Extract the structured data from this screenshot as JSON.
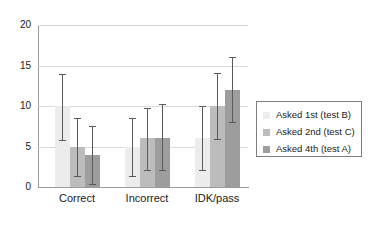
{
  "chart_data": {
    "type": "bar",
    "title": "",
    "subtitle": "",
    "xlabel": "",
    "ylabel": "",
    "categories": [
      "Correct",
      "Incorrect",
      "IDK/pass"
    ],
    "ylim": [
      0,
      20
    ],
    "yticks": [
      0,
      5,
      10,
      15,
      20
    ],
    "ytick_labels": [
      "0",
      "5",
      "10",
      "15",
      "20"
    ],
    "grid": "horizontal",
    "legend_position": "right",
    "orientation": "vertical",
    "series": [
      {
        "name": "Asked 1st (test B)",
        "color": "#ececec",
        "values": [
          10,
          5,
          6
        ],
        "err_low": [
          5.7,
          1.2,
          2.0
        ],
        "err_high": [
          14.0,
          8.5,
          10.0
        ]
      },
      {
        "name": "Asked 2nd (test C)",
        "color": "#bcbcbc",
        "values": [
          5,
          6,
          10
        ],
        "err_low": [
          1.2,
          2.0,
          5.8
        ],
        "err_high": [
          8.5,
          9.8,
          14.1
        ]
      },
      {
        "name": "Asked 4th (test A)",
        "color": "#9d9d9d",
        "values": [
          4,
          6,
          12
        ],
        "err_low": [
          0.2,
          2.0,
          7.9
        ],
        "err_high": [
          7.5,
          10.2,
          16.1
        ]
      }
    ]
  },
  "legend": {
    "entries": [
      {
        "label": "Asked 1st (test B)",
        "swatch": "#ececec"
      },
      {
        "label": "Asked 2nd (test C)",
        "swatch": "#bcbcbc"
      },
      {
        "label": "Asked 4th (test A)",
        "swatch": "#9d9d9d"
      }
    ]
  },
  "axes": {
    "y_tick_labels": [
      "20",
      "15",
      "10",
      "5",
      "0"
    ],
    "x_tick_labels": [
      "Correct",
      "Incorrect",
      "IDK/pass"
    ]
  },
  "colors": {
    "axis": "#9b9b9b",
    "grid": "#d9d9d9",
    "error_bar": "#5a5a5a",
    "text": "#1a1a1a",
    "background": "#ffffff"
  }
}
